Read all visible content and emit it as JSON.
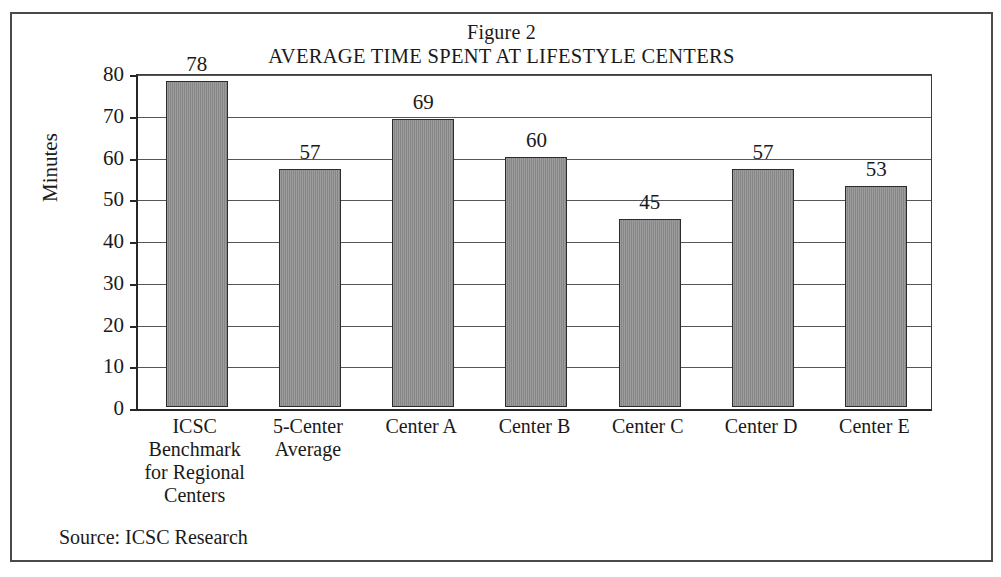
{
  "figure": {
    "title_line1": "Figure 2",
    "title_line2": "AVERAGE TIME SPENT AT LIFESTYLE CENTERS",
    "source_note": "Source: ICSC Research",
    "border_color": "#4a4a4a",
    "bar_color": "#8e8e8e",
    "bar_outline_color": "#2b2b2b",
    "gridline_color": "#555555"
  },
  "chart_data": {
    "type": "bar",
    "title": "AVERAGE TIME SPENT AT LIFESTYLE CENTERS",
    "subtitle": "Figure 2",
    "xlabel": "",
    "ylabel": "Minutes",
    "ylim": [
      0,
      80
    ],
    "ytick_step": 10,
    "yticks": [
      0,
      10,
      20,
      30,
      40,
      50,
      60,
      70,
      80
    ],
    "ytick_labels": [
      "0",
      "10",
      "20",
      "30",
      "40",
      "50",
      "60",
      "70",
      "80"
    ],
    "grid": true,
    "legend": false,
    "data_labels": true,
    "categories": [
      "ICSC Benchmark for Regional Centers",
      "5-Center Average",
      "Center A",
      "Center B",
      "Center C",
      "Center D",
      "Center E"
    ],
    "category_lines": [
      [
        "ICSC",
        "Benchmark",
        "for Regional",
        "Centers"
      ],
      [
        "5-Center",
        "Average"
      ],
      [
        "Center A"
      ],
      [
        "Center B"
      ],
      [
        "Center C"
      ],
      [
        "Center D"
      ],
      [
        "Center E"
      ]
    ],
    "values": [
      78,
      57,
      69,
      60,
      45,
      57,
      53
    ],
    "value_labels": [
      "78",
      "57",
      "69",
      "60",
      "45",
      "57",
      "53"
    ],
    "units": "Minutes",
    "source": "Source: ICSC Research"
  }
}
